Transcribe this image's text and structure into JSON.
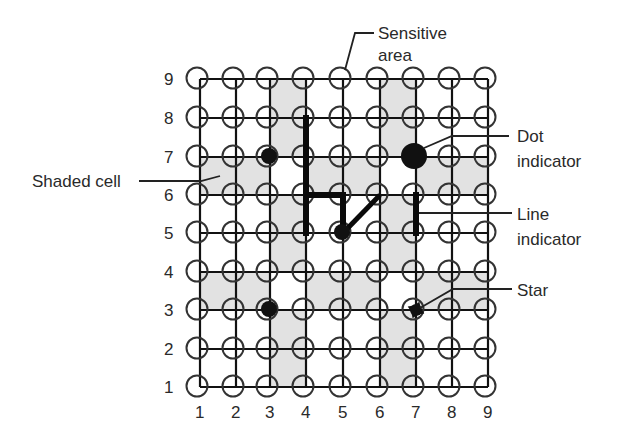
{
  "diagram": {
    "grid": {
      "columns": 9,
      "rows": 9,
      "column_labels": [
        "1",
        "2",
        "3",
        "4",
        "5",
        "6",
        "7",
        "8",
        "9"
      ],
      "row_labels": [
        "9",
        "8",
        "7",
        "6",
        "5",
        "4",
        "3",
        "2",
        "1"
      ],
      "col_x": [
        200,
        236,
        270,
        306,
        343,
        380,
        416,
        452,
        488
      ],
      "row_y": {
        "1": 387,
        "2": 349,
        "3": 310,
        "4": 272,
        "5": 233,
        "6": 195,
        "7": 157,
        "8": 118,
        "9": 79
      }
    },
    "shaded_cells": [
      {
        "col": 3,
        "row": 8
      },
      {
        "col": 6,
        "row": 8
      },
      {
        "col": 3,
        "row": 7
      },
      {
        "col": 6,
        "row": 7
      },
      {
        "col": 1,
        "row": 6
      },
      {
        "col": 2,
        "row": 6
      },
      {
        "col": 4,
        "row": 6
      },
      {
        "col": 5,
        "row": 6
      },
      {
        "col": 7,
        "row": 6
      },
      {
        "col": 8,
        "row": 6
      },
      {
        "col": 3,
        "row": 5
      },
      {
        "col": 6,
        "row": 5
      },
      {
        "col": 3,
        "row": 4
      },
      {
        "col": 6,
        "row": 4
      },
      {
        "col": 1,
        "row": 3
      },
      {
        "col": 2,
        "row": 3
      },
      {
        "col": 4,
        "row": 3
      },
      {
        "col": 5,
        "row": 3
      },
      {
        "col": 7,
        "row": 3
      },
      {
        "col": 8,
        "row": 3
      },
      {
        "col": 3,
        "row": 2
      },
      {
        "col": 6,
        "row": 2
      },
      {
        "col": 3,
        "row": 1
      },
      {
        "col": 6,
        "row": 1
      }
    ],
    "markers": {
      "dots_small": [
        {
          "col": 3,
          "row": 7
        },
        {
          "col": 3,
          "row": 3
        },
        {
          "col": 5,
          "row": 5
        }
      ],
      "dot_large": {
        "col": 7,
        "row": 7
      },
      "star": {
        "col": 7,
        "row": 3
      },
      "lines": [
        {
          "from": [
            4,
            8
          ],
          "to": [
            4,
            5
          ]
        },
        {
          "from": [
            4,
            6
          ],
          "to": [
            5,
            6
          ]
        },
        {
          "from": [
            5,
            6
          ],
          "to": [
            5,
            5
          ]
        },
        {
          "from": [
            5,
            5
          ],
          "to": [
            6,
            6
          ]
        },
        {
          "from": [
            7,
            6
          ],
          "to": [
            7,
            5
          ]
        }
      ]
    },
    "callouts": {
      "sensitive_area": {
        "line1": "Sensitive",
        "line2": "area"
      },
      "shaded_cell": {
        "label": "Shaded cell"
      },
      "dot_indicator": {
        "line1": "Dot",
        "line2": "indicator"
      },
      "line_indicator": {
        "line1": "Line",
        "line2": "indicator"
      },
      "star": {
        "label": "Star"
      }
    },
    "colors": {
      "shade": "#e2e2e2",
      "ink": "#111111",
      "text": "#2a2a2a"
    }
  }
}
